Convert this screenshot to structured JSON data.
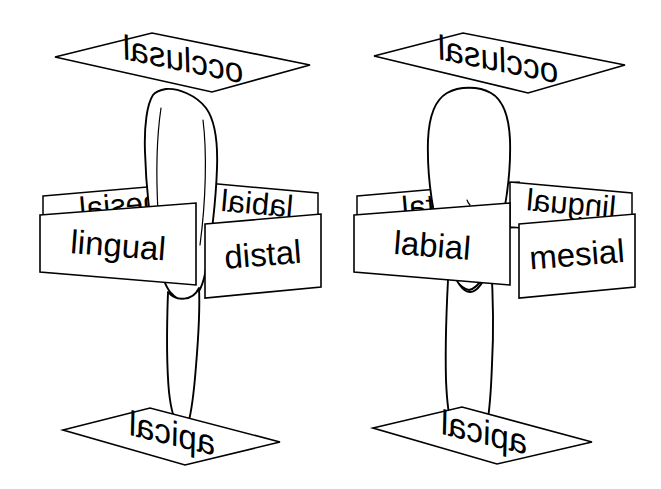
{
  "figure": {
    "background_color": "#ffffff",
    "line_color": "#000000",
    "fill_color": "#ffffff"
  },
  "diagrams": [
    {
      "id": "left",
      "view": "proximal-view",
      "occlusal_label": "occlusal",
      "apical_label": "apical",
      "front_left_label": "lingual",
      "front_right_label": "distal",
      "back_left_label": "mesial",
      "back_right_label": "labial"
    },
    {
      "id": "right",
      "view": "facial-view",
      "occlusal_label": "occlusal",
      "apical_label": "apical",
      "front_left_label": "labial",
      "front_right_label": "mesial",
      "back_left_label": "distal",
      "back_right_label": "lingual"
    }
  ]
}
